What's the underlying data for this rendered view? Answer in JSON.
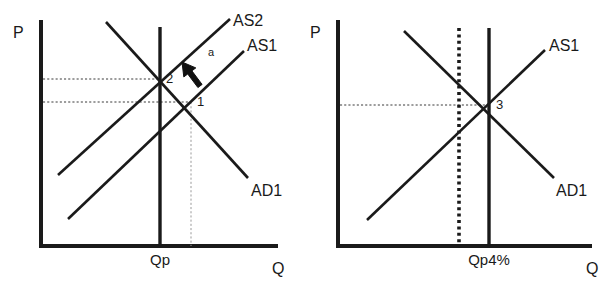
{
  "figure": {
    "width": 602,
    "height": 289,
    "background_color": "#ffffff",
    "line_color": "#1a1a1a",
    "guide_color": "#3a3a3a",
    "guide_faint_color": "#9a9a9a"
  },
  "chart_data": {
    "type": "line",
    "title": "",
    "panels": [
      {
        "id": "left-panel",
        "name": "panel-left",
        "xlabel": "Q",
        "ylabel": "P",
        "grid": false,
        "legend": "inline-curve-labels",
        "axes": {
          "origin": [
            41,
            246
          ],
          "y_axis_top": [
            41,
            22
          ],
          "x_axis_right": [
            276,
            246
          ]
        },
        "curves": [
          {
            "name": "AS2",
            "label": "AS2",
            "type": "upward-sloping-supply",
            "from": [
              58,
              175
            ],
            "to": [
              230,
              19
            ],
            "label_pos": [
              233,
              20
            ],
            "style": "solid"
          },
          {
            "name": "AS1",
            "label": "AS1",
            "type": "upward-sloping-supply",
            "from": [
              68,
              219
            ],
            "to": [
              244,
              51
            ],
            "label_pos": [
              247,
              45
            ],
            "style": "solid"
          },
          {
            "name": "AD1",
            "label": "AD1",
            "type": "downward-sloping-demand",
            "from": [
              106,
              22
            ],
            "to": [
              248,
              178
            ],
            "label_pos": [
              251,
              190
            ],
            "style": "solid"
          },
          {
            "name": "LRAS-Qp",
            "label": "Qp",
            "type": "vertical-potential-output",
            "from": [
              160,
              27
            ],
            "to": [
              160,
              246
            ],
            "label_pos": [
              160,
              265
            ],
            "style": "solid-thick"
          }
        ],
        "points": [
          {
            "label": "2",
            "x": 160,
            "y": 79,
            "label_pos": [
              166,
              83
            ],
            "meaning": "intersection of AS2 and AD1"
          },
          {
            "label": "1",
            "x": 191,
            "y": 102,
            "label_pos": [
              197,
              106
            ],
            "meaning": "intersection of AS1 and AD1"
          }
        ],
        "guides": [
          {
            "name": "price-guide-2",
            "from": [
              43,
              79
            ],
            "to": [
              160,
              79
            ],
            "style": "dashed"
          },
          {
            "name": "price-guide-1",
            "from": [
              43,
              102
            ],
            "to": [
              191,
              102
            ],
            "style": "dashed"
          },
          {
            "name": "quantity-guide-1",
            "from": [
              191,
              102
            ],
            "to": [
              191,
              246
            ],
            "style": "dashed-faint"
          }
        ],
        "annotations": [
          {
            "name": "shift-arrow",
            "label": "a",
            "label_pos": [
              208,
              56
            ],
            "direction": "up-left",
            "tail": [
              200,
              86
            ],
            "head": [
              182,
              62
            ],
            "meaning": "leftward/upward shift of aggregate supply from AS1 to AS2"
          }
        ],
        "tick_labels": [
          {
            "text": "Qp",
            "x": 160,
            "y": 265
          }
        ],
        "axis_labels": [
          {
            "text": "P",
            "x": 13,
            "y": 38
          },
          {
            "text": "Q",
            "x": 272,
            "y": 274
          }
        ]
      },
      {
        "id": "right-panel",
        "name": "panel-right",
        "xlabel": "Q",
        "ylabel": "P",
        "grid": false,
        "legend": "inline-curve-labels",
        "axes": {
          "origin": [
            338,
            246
          ],
          "y_axis_top": [
            338,
            22
          ],
          "x_axis_right": [
            590,
            246
          ]
        },
        "curves": [
          {
            "name": "AS1",
            "label": "AS1",
            "type": "upward-sloping-supply",
            "from": [
              367,
              220
            ],
            "to": [
              545,
              50
            ],
            "label_pos": [
              549,
              45
            ],
            "style": "solid"
          },
          {
            "name": "AD1",
            "label": "AD1",
            "type": "downward-sloping-demand",
            "from": [
              404,
              31
            ],
            "to": [
              554,
              178
            ],
            "label_pos": [
              556,
              190
            ],
            "style": "solid"
          },
          {
            "name": "LRAS-Qp4pct",
            "label": "Qp4%",
            "type": "vertical-potential-output",
            "from": [
              489,
              28
            ],
            "to": [
              489,
              246
            ],
            "label_pos": [
              489,
              265
            ],
            "style": "solid-thick"
          },
          {
            "name": "old-potential-output",
            "label": "",
            "type": "vertical-dotted-reference",
            "from": [
              459,
              28
            ],
            "to": [
              459,
              246
            ],
            "style": "dotted-thick"
          }
        ],
        "points": [
          {
            "label": "3",
            "x": 489,
            "y": 105,
            "label_pos": [
              496,
              109
            ],
            "meaning": "intersection of AS1 and AD1 at new potential output"
          }
        ],
        "guides": [
          {
            "name": "price-guide-3",
            "from": [
              340,
              105
            ],
            "to": [
              489,
              105
            ],
            "style": "dashed"
          }
        ],
        "annotations": [],
        "tick_labels": [
          {
            "text": "Qp4%",
            "x": 489,
            "y": 265
          }
        ],
        "axis_labels": [
          {
            "text": "P",
            "x": 310,
            "y": 38
          },
          {
            "text": "Q",
            "x": 586,
            "y": 274
          }
        ]
      }
    ]
  }
}
